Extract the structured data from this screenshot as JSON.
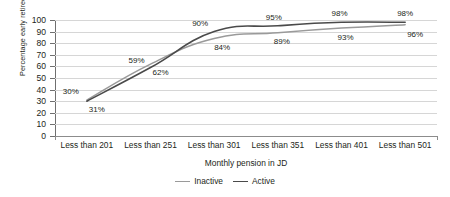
{
  "chart_data": {
    "type": "line",
    "title": "",
    "xlabel": "Monthly pension in JD",
    "ylabel": "Percentage early retirees",
    "categories": [
      "Less than 201",
      "Less than 251",
      "Less than 301",
      "Less than 351",
      "Less than 401",
      "Less than 501"
    ],
    "series": [
      {
        "name": "Inactive",
        "color": "#9a9a9a",
        "values": [
          31,
          62,
          84,
          89,
          93,
          96
        ],
        "labels": [
          "31%",
          "62%",
          "84%",
          "89%",
          "93%",
          "96%"
        ]
      },
      {
        "name": "Active",
        "color": "#4a4a4a",
        "values": [
          30,
          59,
          90,
          95,
          98,
          98
        ],
        "labels": [
          "30%",
          "59%",
          "90%",
          "95%",
          "98%",
          "98%"
        ]
      }
    ],
    "ylim": [
      0,
      100
    ],
    "ytick_step": 10,
    "yticks": [
      "100",
      "90",
      "80",
      "70",
      "60",
      "50",
      "40",
      "30",
      "20",
      "10",
      "0"
    ],
    "grid": true,
    "legend_position": "bottom-center",
    "legend": [
      "Inactive",
      "Active"
    ]
  }
}
